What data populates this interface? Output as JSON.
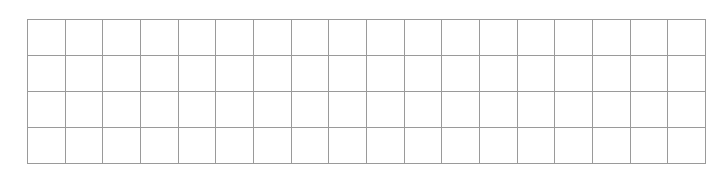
{
  "grid": {
    "rows": 4,
    "columns": 18,
    "line_color": "#9a9a9a",
    "background_color": "#ffffff",
    "cells_filled": false
  }
}
